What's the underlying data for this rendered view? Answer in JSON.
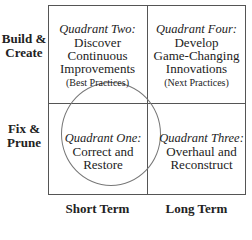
{
  "row_labels": {
    "top": [
      "Build &",
      "Create"
    ],
    "bottom": [
      "Fix &",
      "Prune"
    ]
  },
  "column_labels": {
    "left": "Short Term",
    "right": "Long Term"
  },
  "quadrants": {
    "two": {
      "title": "Quadrant Two:",
      "lines": [
        "Discover",
        "Continuous",
        "Improvements"
      ],
      "sub": "(Best Practices)"
    },
    "four": {
      "title": "Quadrant Four:",
      "lines": [
        "Develop",
        "Game-Changing",
        "Innovations"
      ],
      "sub": "(Next Practices)"
    },
    "one": {
      "title": "Quadrant One:",
      "lines": [
        "Correct and",
        "Restore"
      ]
    },
    "three": {
      "title": "Quadrant Three:",
      "lines": [
        "Overhaul and",
        "Reconstruct"
      ]
    }
  },
  "highlight": {
    "shape": "circle",
    "quadrant": "one"
  }
}
